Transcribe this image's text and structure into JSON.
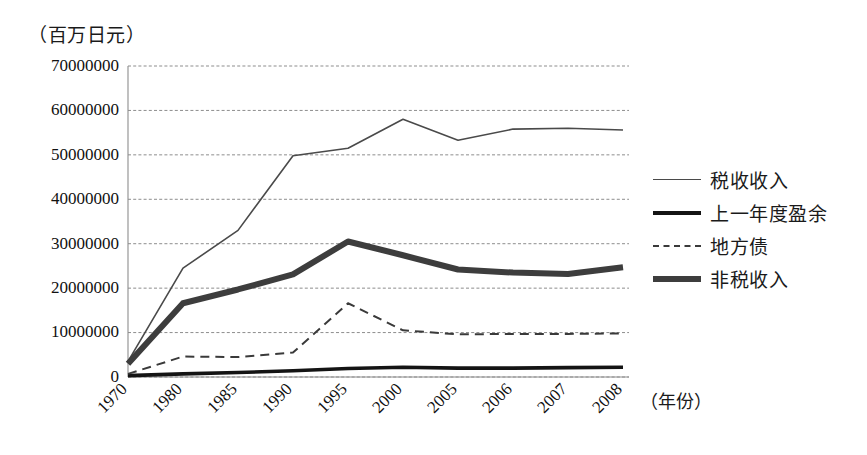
{
  "chart_data": {
    "type": "line",
    "title": "",
    "unit_label": "（百万日元）",
    "xlabel": "（年份）",
    "ylabel": "",
    "categories": [
      "1970",
      "1980",
      "1985",
      "1990",
      "1995",
      "2000",
      "2005",
      "2006",
      "2007",
      "2008"
    ],
    "ylim": [
      0,
      70000000
    ],
    "ytick_labels": [
      "70000000",
      "60000000",
      "50000000",
      "40000000",
      "30000000",
      "20000000",
      "10000000",
      "0"
    ],
    "ytick_values": [
      70000000,
      60000000,
      50000000,
      40000000,
      30000000,
      20000000,
      10000000,
      0
    ],
    "grid": true,
    "legend_position": "right",
    "series": [
      {
        "name": "税收收入",
        "style": "thin-solid",
        "color": "#4a4a4a",
        "width": 1.6,
        "values": [
          3500000,
          24500000,
          33000000,
          49800000,
          51500000,
          58000000,
          53300000,
          55800000,
          56000000,
          55600000
        ]
      },
      {
        "name": "上一年度盈余",
        "style": "medium-solid",
        "color": "#141414",
        "width": 3.6,
        "values": [
          300000,
          700000,
          1000000,
          1400000,
          1900000,
          2200000,
          2000000,
          2000000,
          2100000,
          2200000
        ]
      },
      {
        "name": "地方债",
        "style": "dashed",
        "color": "#3a3a3a",
        "width": 2,
        "values": [
          700000,
          4600000,
          4500000,
          5500000,
          16600000,
          10500000,
          9600000,
          9700000,
          9700000,
          9800000
        ]
      },
      {
        "name": "非税收入",
        "style": "thick-solid",
        "color": "#3d3d3d",
        "width": 6,
        "values": [
          3000000,
          16600000,
          19700000,
          23100000,
          30500000,
          27400000,
          24200000,
          23500000,
          23200000,
          24700000
        ]
      }
    ]
  },
  "legend": {
    "items": [
      {
        "label": "税收收入",
        "style": "thin-solid"
      },
      {
        "label": "上一年度盈余",
        "style": "medium-solid"
      },
      {
        "label": "地方债",
        "style": "dashed"
      },
      {
        "label": "非税收入",
        "style": "thick-solid"
      }
    ]
  }
}
